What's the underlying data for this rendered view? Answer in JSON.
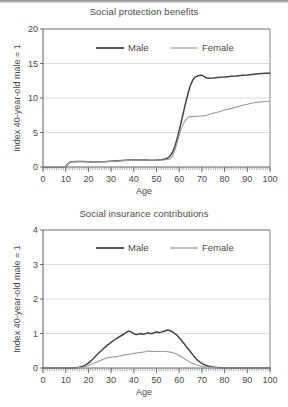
{
  "figure": {
    "background": "#ffffff",
    "male_color": "#444444",
    "female_color": "#9a9a9a",
    "axis_color": "#6b6b6b",
    "grid_color": "#c9c9c9"
  },
  "chart_data": [
    {
      "type": "line",
      "id": "social-protection-benefits",
      "title": "Social protection benefits",
      "xlabel": "Age",
      "ylabel": "Index 40-year-old male = 1",
      "xlim": [
        0,
        100
      ],
      "ylim": [
        0,
        20
      ],
      "xticks": [
        0,
        10,
        20,
        30,
        40,
        50,
        60,
        70,
        80,
        90,
        100
      ],
      "yticks": [
        0,
        5,
        10,
        15,
        20
      ],
      "minor_xticks": true,
      "grid": "horizontal",
      "legend": [
        "Male",
        "Female"
      ],
      "legend_position": "top-center",
      "x": [
        0,
        2,
        4,
        6,
        8,
        10,
        11,
        12,
        13,
        15,
        18,
        20,
        23,
        25,
        28,
        30,
        33,
        35,
        38,
        40,
        43,
        45,
        47,
        49,
        50,
        52,
        54,
        55,
        56,
        57,
        58,
        59,
        60,
        61,
        62,
        63,
        64,
        65,
        66,
        67,
        68,
        69,
        70,
        71,
        72,
        73,
        75,
        78,
        80,
        83,
        85,
        88,
        90,
        93,
        95,
        98,
        100
      ],
      "series": [
        {
          "name": "Male",
          "color": "#444444",
          "values": [
            0.05,
            0.05,
            0.05,
            0.05,
            0.05,
            0.08,
            0.45,
            0.72,
            0.76,
            0.78,
            0.78,
            0.77,
            0.76,
            0.75,
            0.78,
            0.82,
            0.9,
            0.95,
            1.0,
            1.02,
            1.02,
            1.0,
            0.98,
            0.98,
            1.0,
            1.05,
            1.15,
            1.3,
            1.6,
            2.1,
            2.9,
            4.0,
            5.3,
            6.7,
            8.1,
            9.5,
            10.8,
            11.9,
            12.6,
            13.0,
            13.2,
            13.25,
            13.3,
            13.1,
            12.9,
            12.85,
            12.9,
            13.0,
            13.05,
            13.15,
            13.2,
            13.3,
            13.35,
            13.45,
            13.5,
            13.58,
            13.6
          ]
        },
        {
          "name": "Female",
          "color": "#9a9a9a",
          "values": [
            0.05,
            0.05,
            0.05,
            0.05,
            0.05,
            0.08,
            0.45,
            0.72,
            0.76,
            0.78,
            0.78,
            0.77,
            0.76,
            0.75,
            0.78,
            0.82,
            0.88,
            0.92,
            0.96,
            0.98,
            0.99,
            0.98,
            0.97,
            0.98,
            1.0,
            1.02,
            1.05,
            1.08,
            1.15,
            1.5,
            2.3,
            3.4,
            4.6,
            5.6,
            6.4,
            6.9,
            7.2,
            7.3,
            7.32,
            7.33,
            7.35,
            7.38,
            7.4,
            7.45,
            7.5,
            7.6,
            7.8,
            8.05,
            8.25,
            8.5,
            8.68,
            8.95,
            9.1,
            9.3,
            9.4,
            9.5,
            9.52
          ]
        }
      ]
    },
    {
      "type": "line",
      "id": "social-insurance-contributions",
      "title": "Social insurance contributions",
      "xlabel": "Age",
      "ylabel": "Index 40-year-old male = 1",
      "xlim": [
        0,
        100
      ],
      "ylim": [
        0,
        4
      ],
      "xticks": [
        0,
        10,
        20,
        30,
        40,
        50,
        60,
        70,
        80,
        90,
        100
      ],
      "yticks": [
        0,
        1,
        2,
        3,
        4
      ],
      "minor_xticks": true,
      "grid": "horizontal",
      "legend": [
        "Male",
        "Female"
      ],
      "legend_position": "top-center",
      "x": [
        0,
        5,
        10,
        14,
        16,
        18,
        20,
        22,
        24,
        26,
        28,
        30,
        32,
        34,
        36,
        37,
        38,
        39,
        40,
        41,
        42,
        43,
        44,
        45,
        46,
        47,
        48,
        49,
        50,
        51,
        52,
        53,
        54,
        55,
        56,
        57,
        58,
        59,
        60,
        61,
        62,
        63,
        64,
        65,
        66,
        67,
        68,
        70,
        72,
        74,
        76,
        78,
        80,
        85,
        90,
        95,
        100
      ],
      "series": [
        {
          "name": "Male",
          "color": "#444444",
          "values": [
            0.0,
            0.0,
            0.0,
            0.0,
            0.02,
            0.06,
            0.14,
            0.26,
            0.4,
            0.52,
            0.64,
            0.74,
            0.84,
            0.92,
            1.0,
            1.05,
            1.07,
            1.04,
            0.99,
            0.97,
            0.98,
            1.0,
            0.98,
            0.99,
            1.02,
            1.0,
            1.0,
            1.02,
            1.05,
            1.03,
            1.04,
            1.06,
            1.08,
            1.1,
            1.08,
            1.05,
            1.0,
            0.95,
            0.88,
            0.8,
            0.72,
            0.63,
            0.55,
            0.47,
            0.38,
            0.3,
            0.23,
            0.13,
            0.07,
            0.04,
            0.02,
            0.01,
            0.0,
            0.0,
            0.0,
            0.0,
            0.0
          ]
        },
        {
          "name": "Female",
          "color": "#9a9a9a",
          "values": [
            0.0,
            0.0,
            0.0,
            0.0,
            0.01,
            0.03,
            0.07,
            0.12,
            0.18,
            0.24,
            0.29,
            0.31,
            0.33,
            0.35,
            0.38,
            0.39,
            0.4,
            0.41,
            0.42,
            0.43,
            0.44,
            0.45,
            0.46,
            0.47,
            0.49,
            0.49,
            0.48,
            0.48,
            0.48,
            0.48,
            0.48,
            0.48,
            0.48,
            0.47,
            0.46,
            0.45,
            0.43,
            0.4,
            0.36,
            0.32,
            0.28,
            0.24,
            0.2,
            0.16,
            0.13,
            0.1,
            0.08,
            0.05,
            0.03,
            0.02,
            0.01,
            0.0,
            0.0,
            0.0,
            0.0,
            0.0,
            0.0
          ]
        }
      ]
    }
  ]
}
